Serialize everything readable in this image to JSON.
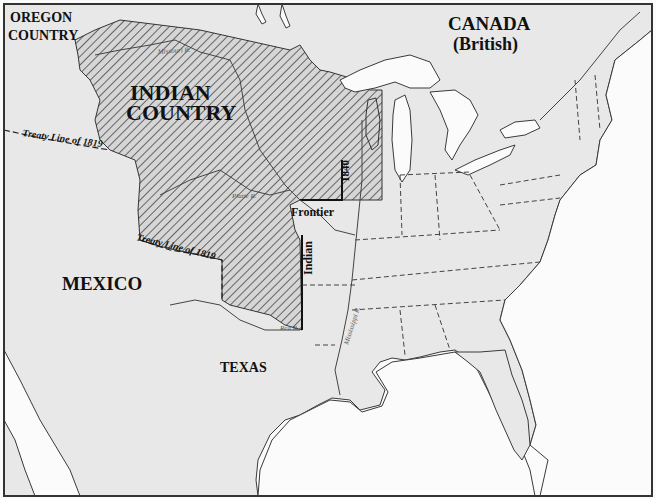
{
  "map": {
    "regions": {
      "oregon_1": "OREGON",
      "oregon_2": "COUNTRY",
      "canada_1": "CANADA",
      "canada_2": "(British)",
      "indian_country_1": "INDIAN",
      "indian_country_2": "COUNTRY",
      "mexico": "MEXICO",
      "texas": "TEXAS"
    },
    "lines": {
      "treaty_north": "Treaty Line of 1819",
      "treaty_south": "Treaty Line of 1819",
      "frontier_year": "1840",
      "frontier_label": "Frontier",
      "frontier_indian": "Indian"
    },
    "rivers": {
      "missouri": "Missouri R.",
      "platte": "Platte R.",
      "red": "Red R.",
      "mississippi": "Mississippi R."
    },
    "colors": {
      "land": "#e8e8e8",
      "water": "#fbfbfb",
      "hatch": "#333333",
      "border": "#444444"
    }
  }
}
